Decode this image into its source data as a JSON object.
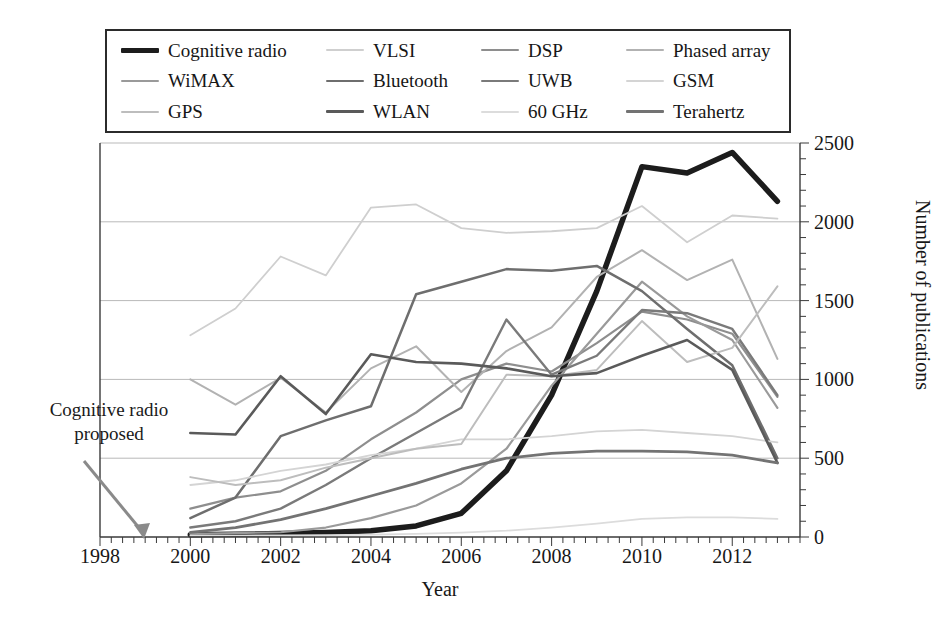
{
  "chart_data": {
    "type": "line",
    "title": "",
    "xlabel": "Year",
    "ylabel": "Number of publications",
    "xlim": [
      1998,
      2013.5
    ],
    "ylim": [
      0,
      2500
    ],
    "x_ticks": [
      1998,
      2000,
      2002,
      2004,
      2006,
      2008,
      2010,
      2012
    ],
    "x_minor_tick_step": 0.25,
    "y_ticks": [
      0,
      500,
      1000,
      1500,
      2000,
      2500
    ],
    "grid": "horizontal",
    "y_axis_position": "right",
    "legend_position": "top-outside",
    "legend_columns": 4,
    "x": [
      2000,
      2001,
      2002,
      2003,
      2004,
      2005,
      2006,
      2007,
      2008,
      2009,
      2010,
      2011,
      2012,
      2013
    ],
    "series": [
      {
        "name": "Cognitive radio",
        "color": "#1c1c1c",
        "width": 5.5,
        "values": [
          15,
          18,
          22,
          28,
          40,
          70,
          150,
          420,
          900,
          1560,
          2350,
          2310,
          2440,
          2130
        ]
      },
      {
        "name": "VLSI",
        "color": "#cfcfcf",
        "width": 1.8,
        "values": [
          1280,
          1450,
          1780,
          1660,
          2090,
          2110,
          1960,
          1930,
          1940,
          1960,
          2100,
          1870,
          2040,
          2020
        ]
      },
      {
        "name": "DSP",
        "color": "#8e8e8e",
        "width": 2.2,
        "values": [
          180,
          250,
          290,
          420,
          620,
          790,
          1000,
          1100,
          1050,
          1230,
          1430,
          1380,
          1290,
          890
        ]
      },
      {
        "name": "Phased array",
        "color": "#b2b2b2",
        "width": 2.0,
        "values": [
          1000,
          840,
          1010,
          790,
          1070,
          1210,
          920,
          1180,
          1330,
          1650,
          1820,
          1630,
          1760,
          1130
        ]
      },
      {
        "name": "WiMAX",
        "color": "#9a9a9a",
        "width": 2.2,
        "values": [
          20,
          25,
          30,
          60,
          120,
          200,
          340,
          560,
          960,
          1290,
          1620,
          1400,
          1250,
          820
        ]
      },
      {
        "name": "Bluetooth",
        "color": "#6e6e6e",
        "width": 2.5,
        "values": [
          120,
          250,
          640,
          740,
          830,
          1540,
          1620,
          1700,
          1690,
          1720,
          1560,
          1320,
          1090,
          500
        ]
      },
      {
        "name": "UWB",
        "color": "#7a7a7a",
        "width": 2.4,
        "values": [
          60,
          100,
          180,
          330,
          500,
          660,
          820,
          1380,
          1030,
          1150,
          1440,
          1420,
          1320,
          900
        ]
      },
      {
        "name": "GSM",
        "color": "#d4d4d4",
        "width": 1.8,
        "values": [
          330,
          360,
          420,
          460,
          520,
          560,
          620,
          620,
          640,
          670,
          680,
          660,
          640,
          600
        ]
      },
      {
        "name": "GPS",
        "color": "#bdbdbd",
        "width": 2.0,
        "values": [
          380,
          330,
          360,
          440,
          500,
          560,
          590,
          1030,
          1020,
          1060,
          1370,
          1110,
          1200,
          1590
        ]
      },
      {
        "name": "WLAN",
        "color": "#5a5a5a",
        "width": 2.6,
        "values": [
          660,
          650,
          1020,
          780,
          1160,
          1110,
          1100,
          1070,
          1020,
          1040,
          1150,
          1250,
          1060,
          470
        ]
      },
      {
        "name": "60 GHz",
        "color": "#dcdcdc",
        "width": 1.8,
        "values": [
          8,
          9,
          10,
          12,
          15,
          20,
          28,
          40,
          60,
          85,
          115,
          125,
          125,
          115
        ]
      },
      {
        "name": "Terahertz",
        "color": "#737373",
        "width": 2.8,
        "values": [
          30,
          60,
          110,
          180,
          260,
          340,
          430,
          500,
          530,
          545,
          545,
          540,
          520,
          470
        ]
      }
    ]
  },
  "legend": {
    "entries": [
      {
        "label": "Cognitive radio",
        "swatch": "legend-swatch-cognitive-radio"
      },
      {
        "label": "VLSI",
        "swatch": "legend-swatch-vlsi"
      },
      {
        "label": "DSP",
        "swatch": "legend-swatch-dsp"
      },
      {
        "label": "Phased array",
        "swatch": "legend-swatch-phased-array"
      },
      {
        "label": "WiMAX",
        "swatch": "legend-swatch-wimax"
      },
      {
        "label": "Bluetooth",
        "swatch": "legend-swatch-bluetooth"
      },
      {
        "label": "UWB",
        "swatch": "legend-swatch-uwb"
      },
      {
        "label": "GSM",
        "swatch": "legend-swatch-gsm"
      },
      {
        "label": "GPS",
        "swatch": "legend-swatch-gps"
      },
      {
        "label": "WLAN",
        "swatch": "legend-swatch-wlan"
      },
      {
        "label": "60 GHz",
        "swatch": "legend-swatch-60-ghz"
      },
      {
        "label": "Terahertz",
        "swatch": "legend-swatch-terahertz"
      }
    ]
  },
  "annotation": {
    "line1": "Cognitive radio",
    "line2": "proposed",
    "arrow_target_year": 1999
  },
  "axes": {
    "x_title": "Year",
    "y_title": "Number of publications"
  },
  "colors": {
    "axis": "#3a3a3a",
    "grid": "#b9b9b9",
    "text": "#171717",
    "legend_border": "#2b2b2b",
    "annotation_arrow": "#8a8a8a"
  }
}
